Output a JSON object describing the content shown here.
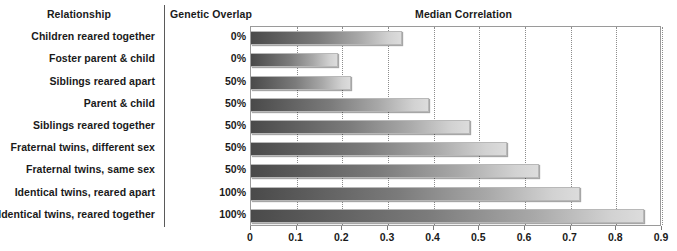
{
  "headers": {
    "relationship": "Relationship",
    "genetic_overlap": "Genetic Overlap",
    "median_correlation": "Median Correlation"
  },
  "rows": [
    {
      "relationship": "Children reared together",
      "genetic_overlap": "0%",
      "median_correlation": 0.33
    },
    {
      "relationship": "Foster parent & child",
      "genetic_overlap": "0%",
      "median_correlation": 0.19
    },
    {
      "relationship": "Siblings reared apart",
      "genetic_overlap": "50%",
      "median_correlation": 0.22
    },
    {
      "relationship": "Parent & child",
      "genetic_overlap": "50%",
      "median_correlation": 0.39
    },
    {
      "relationship": "Siblings reared together",
      "genetic_overlap": "50%",
      "median_correlation": 0.48
    },
    {
      "relationship": "Fraternal twins, different sex",
      "genetic_overlap": "50%",
      "median_correlation": 0.56
    },
    {
      "relationship": "Fraternal twins, same sex",
      "genetic_overlap": "50%",
      "median_correlation": 0.63
    },
    {
      "relationship": "Identical twins, reared apart",
      "genetic_overlap": "100%",
      "median_correlation": 0.72
    },
    {
      "relationship": "Identical twins, reared together",
      "genetic_overlap": "100%",
      "median_correlation": 0.86
    }
  ],
  "axis": {
    "ticks": [
      "0",
      "0.1",
      "0.2",
      "0.3",
      "0.4",
      "0.5",
      "0.6",
      "0.7",
      "0.8",
      "0.9"
    ],
    "min": 0,
    "max": 0.9
  },
  "colors": {
    "bar_dark": "#4a4a4a",
    "bar_light": "#dcdcdc",
    "gridline": "#8c8c8c",
    "text": "#1a1a1a"
  },
  "chart_data": {
    "type": "bar",
    "orientation": "horizontal",
    "title": "Median Correlation",
    "xlabel": "",
    "ylabel": "Relationship",
    "xlim": [
      0,
      0.9
    ],
    "grid": true,
    "legend": "none",
    "categories": [
      "Children reared together",
      "Foster parent & child",
      "Siblings reared apart",
      "Parent & child",
      "Siblings reared together",
      "Fraternal twins, different sex",
      "Fraternal twins, same sex",
      "Identical twins, reared apart",
      "Identical twins, reared together"
    ],
    "values": [
      0.33,
      0.19,
      0.22,
      0.39,
      0.48,
      0.56,
      0.63,
      0.72,
      0.86
    ],
    "annotations": {
      "Genetic Overlap": [
        "0%",
        "0%",
        "50%",
        "50%",
        "50%",
        "50%",
        "50%",
        "100%",
        "100%"
      ]
    },
    "xticks": [
      0,
      0.1,
      0.2,
      0.3,
      0.4,
      0.5,
      0.6,
      0.7,
      0.8,
      0.9
    ]
  }
}
